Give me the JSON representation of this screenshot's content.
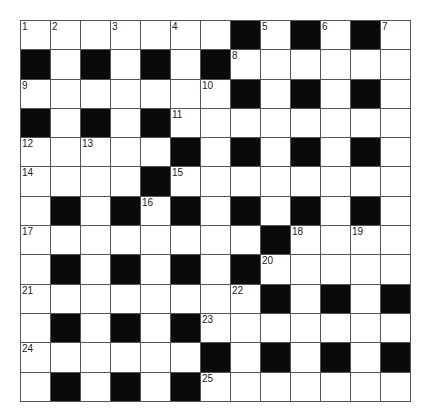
{
  "puzzle": {
    "rows": 13,
    "cols": 13,
    "colors": {
      "black": "#0a0a0a",
      "white": "#ffffff",
      "line": "#555555"
    },
    "grid": [
      "WWWWWWWBWBWBW",
      "BWBWBWBWWWWWW",
      "WWWWWWWBWBWBW",
      "BWBWBWWWWWWWW",
      "WWWWWBWBWBWBW",
      "WWWWBWWWWWWWW",
      "WBWBWBWBWBWBW",
      "WWWWWWWWBWWWW",
      "WBWBWBWBWWWWW",
      "WWWWWWWWBWBWB",
      "WBWBWBWWWWWWW",
      "WWWWWWBWBWBWB",
      "WBWBWBWWWWWWW"
    ],
    "numbers": [
      {
        "r": 0,
        "c": 0,
        "n": "1"
      },
      {
        "r": 0,
        "c": 1,
        "n": "2"
      },
      {
        "r": 0,
        "c": 3,
        "n": "3"
      },
      {
        "r": 0,
        "c": 5,
        "n": "4"
      },
      {
        "r": 0,
        "c": 8,
        "n": "5"
      },
      {
        "r": 0,
        "c": 10,
        "n": "6"
      },
      {
        "r": 0,
        "c": 12,
        "n": "7"
      },
      {
        "r": 1,
        "c": 7,
        "n": "8"
      },
      {
        "r": 2,
        "c": 0,
        "n": "9"
      },
      {
        "r": 2,
        "c": 6,
        "n": "10"
      },
      {
        "r": 3,
        "c": 5,
        "n": "11"
      },
      {
        "r": 4,
        "c": 0,
        "n": "12"
      },
      {
        "r": 4,
        "c": 2,
        "n": "13"
      },
      {
        "r": 5,
        "c": 0,
        "n": "14"
      },
      {
        "r": 5,
        "c": 5,
        "n": "15"
      },
      {
        "r": 6,
        "c": 4,
        "n": "16"
      },
      {
        "r": 7,
        "c": 0,
        "n": "17"
      },
      {
        "r": 7,
        "c": 9,
        "n": "18"
      },
      {
        "r": 7,
        "c": 11,
        "n": "19"
      },
      {
        "r": 8,
        "c": 8,
        "n": "20"
      },
      {
        "r": 9,
        "c": 0,
        "n": "21"
      },
      {
        "r": 9,
        "c": 7,
        "n": "22"
      },
      {
        "r": 10,
        "c": 6,
        "n": "23"
      },
      {
        "r": 11,
        "c": 0,
        "n": "24"
      },
      {
        "r": 12,
        "c": 6,
        "n": "25"
      }
    ]
  }
}
